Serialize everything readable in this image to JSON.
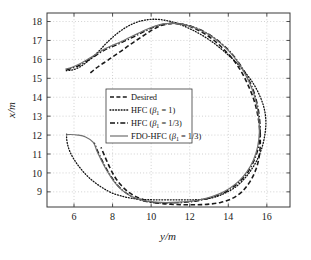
{
  "chart_data": {
    "type": "line",
    "title": "",
    "xlabel": "y/m",
    "ylabel": "x/m",
    "xlim": [
      4.6,
      17.2
    ],
    "ylim": [
      8.2,
      18.45
    ],
    "xticks": [
      6,
      8,
      10,
      12,
      14,
      16
    ],
    "yticks": [
      9,
      10,
      11,
      12,
      13,
      14,
      15,
      16,
      17,
      18
    ],
    "grid": true,
    "grid_style": "dotted",
    "legend_position": "center",
    "series": [
      {
        "name": "Desired",
        "style": "dashed",
        "color": "#1a1a1a",
        "points": [
          [
            6.85,
            15.28
          ],
          [
            7.1,
            15.5
          ],
          [
            7.4,
            15.72
          ],
          [
            7.75,
            15.95
          ],
          [
            8.1,
            16.2
          ],
          [
            8.5,
            16.48
          ],
          [
            8.9,
            16.78
          ],
          [
            9.3,
            17.05
          ],
          [
            9.7,
            17.32
          ],
          [
            10.1,
            17.58
          ],
          [
            10.5,
            17.78
          ],
          [
            10.9,
            17.88
          ],
          [
            11.3,
            17.9
          ],
          [
            11.75,
            17.82
          ],
          [
            12.2,
            17.66
          ],
          [
            12.7,
            17.4
          ],
          [
            13.2,
            17.05
          ],
          [
            13.7,
            16.6
          ],
          [
            14.2,
            16.05
          ],
          [
            14.65,
            15.4
          ],
          [
            15.0,
            14.7
          ],
          [
            15.3,
            13.95
          ],
          [
            15.5,
            13.2
          ],
          [
            15.62,
            12.4
          ],
          [
            15.66,
            11.6
          ],
          [
            15.6,
            10.85
          ],
          [
            15.42,
            10.15
          ],
          [
            15.1,
            9.5
          ],
          [
            14.7,
            9.0
          ],
          [
            14.2,
            8.65
          ],
          [
            13.6,
            8.44
          ],
          [
            13.0,
            8.35
          ],
          [
            12.4,
            8.32
          ],
          [
            11.8,
            8.32
          ],
          [
            11.2,
            8.34
          ],
          [
            10.6,
            8.38
          ],
          [
            10.1,
            8.45
          ],
          [
            9.6,
            8.58
          ],
          [
            9.15,
            8.78
          ],
          [
            8.75,
            9.05
          ],
          [
            8.4,
            9.4
          ],
          [
            8.1,
            9.82
          ],
          [
            7.85,
            10.3
          ],
          [
            7.62,
            10.82
          ],
          [
            7.4,
            11.35
          ]
        ]
      },
      {
        "name": "HFC (β₁ = 1)",
        "style": "dotted",
        "color": "#111111",
        "points": [
          [
            5.62,
            12.05
          ],
          [
            5.62,
            11.8
          ],
          [
            5.68,
            11.45
          ],
          [
            5.8,
            11.1
          ],
          [
            5.98,
            10.75
          ],
          [
            6.2,
            10.42
          ],
          [
            6.45,
            10.1
          ],
          [
            6.75,
            9.78
          ],
          [
            7.1,
            9.48
          ],
          [
            7.5,
            9.2
          ],
          [
            7.95,
            8.95
          ],
          [
            8.45,
            8.78
          ],
          [
            9.0,
            8.66
          ],
          [
            9.6,
            8.6
          ],
          [
            10.2,
            8.58
          ],
          [
            10.9,
            8.58
          ],
          [
            11.6,
            8.58
          ],
          [
            12.2,
            8.58
          ],
          [
            12.8,
            8.62
          ],
          [
            13.3,
            8.72
          ],
          [
            13.8,
            8.92
          ],
          [
            14.3,
            9.2
          ],
          [
            14.75,
            9.6
          ],
          [
            15.15,
            10.1
          ],
          [
            15.5,
            10.7
          ],
          [
            15.75,
            11.35
          ],
          [
            15.9,
            12.05
          ],
          [
            15.95,
            12.75
          ],
          [
            15.85,
            13.45
          ],
          [
            15.6,
            14.15
          ],
          [
            15.25,
            14.8
          ],
          [
            14.8,
            15.4
          ],
          [
            14.3,
            15.95
          ],
          [
            13.75,
            16.45
          ],
          [
            13.2,
            16.9
          ],
          [
            12.6,
            17.3
          ],
          [
            12.0,
            17.62
          ],
          [
            11.4,
            17.88
          ],
          [
            10.8,
            18.05
          ],
          [
            10.2,
            18.12
          ],
          [
            9.6,
            18.06
          ],
          [
            9.05,
            17.88
          ],
          [
            8.55,
            17.6
          ],
          [
            8.1,
            17.25
          ],
          [
            7.7,
            16.88
          ],
          [
            7.35,
            16.5
          ],
          [
            7.0,
            16.15
          ],
          [
            6.65,
            15.85
          ],
          [
            6.3,
            15.6
          ],
          [
            5.95,
            15.45
          ],
          [
            5.6,
            15.4
          ]
        ]
      },
      {
        "name": "HFC (β₁ = 1/3)",
        "style": "dashdot",
        "color": "#111111",
        "points": [
          [
            5.6,
            15.45
          ],
          [
            5.95,
            15.55
          ],
          [
            6.3,
            15.7
          ],
          [
            6.65,
            15.9
          ],
          [
            7.0,
            16.12
          ],
          [
            7.35,
            16.35
          ],
          [
            7.7,
            16.55
          ],
          [
            8.05,
            16.7
          ],
          [
            8.45,
            16.88
          ],
          [
            8.9,
            17.1
          ],
          [
            9.35,
            17.32
          ],
          [
            9.8,
            17.55
          ],
          [
            10.25,
            17.75
          ],
          [
            10.7,
            17.87
          ],
          [
            11.15,
            17.9
          ],
          [
            11.6,
            17.86
          ],
          [
            12.1,
            17.74
          ],
          [
            12.6,
            17.54
          ],
          [
            13.1,
            17.25
          ],
          [
            13.6,
            16.88
          ],
          [
            14.1,
            16.4
          ],
          [
            14.55,
            15.82
          ],
          [
            14.95,
            15.15
          ],
          [
            15.28,
            14.42
          ],
          [
            15.5,
            13.65
          ],
          [
            15.62,
            12.88
          ],
          [
            15.65,
            12.1
          ],
          [
            15.56,
            11.35
          ],
          [
            15.35,
            10.68
          ],
          [
            15.02,
            10.05
          ],
          [
            14.6,
            9.55
          ],
          [
            14.1,
            9.15
          ],
          [
            13.55,
            8.85
          ],
          [
            12.95,
            8.65
          ],
          [
            12.35,
            8.52
          ],
          [
            11.75,
            8.45
          ],
          [
            11.15,
            8.42
          ],
          [
            10.55,
            8.42
          ],
          [
            10.0,
            8.45
          ],
          [
            9.5,
            8.55
          ],
          [
            9.05,
            8.72
          ],
          [
            8.65,
            8.98
          ],
          [
            8.3,
            9.3
          ],
          [
            8.0,
            9.7
          ],
          [
            7.72,
            10.15
          ],
          [
            7.48,
            10.62
          ],
          [
            7.25,
            11.1
          ],
          [
            7.05,
            11.6
          ]
        ]
      },
      {
        "name": "FDO-HFC (β₁ = 1/3)",
        "style": "solid",
        "color": "#707070",
        "points": [
          [
            5.55,
            15.48
          ],
          [
            5.9,
            15.58
          ],
          [
            6.25,
            15.74
          ],
          [
            6.6,
            15.94
          ],
          [
            6.95,
            16.15
          ],
          [
            7.3,
            16.38
          ],
          [
            7.65,
            16.58
          ],
          [
            8.0,
            16.74
          ],
          [
            8.4,
            16.92
          ],
          [
            8.85,
            17.14
          ],
          [
            9.3,
            17.36
          ],
          [
            9.75,
            17.58
          ],
          [
            10.2,
            17.76
          ],
          [
            10.65,
            17.88
          ],
          [
            11.1,
            17.9
          ],
          [
            11.55,
            17.86
          ],
          [
            12.05,
            17.74
          ],
          [
            12.55,
            17.55
          ],
          [
            13.05,
            17.27
          ],
          [
            13.55,
            16.9
          ],
          [
            14.05,
            16.42
          ],
          [
            14.5,
            15.85
          ],
          [
            14.9,
            15.18
          ],
          [
            15.23,
            14.45
          ],
          [
            15.46,
            13.68
          ],
          [
            15.58,
            12.9
          ],
          [
            15.61,
            12.12
          ],
          [
            15.52,
            11.38
          ],
          [
            15.31,
            10.7
          ],
          [
            14.98,
            10.08
          ],
          [
            14.56,
            9.58
          ],
          [
            14.06,
            9.18
          ],
          [
            13.5,
            8.88
          ],
          [
            12.9,
            8.67
          ],
          [
            12.3,
            8.54
          ],
          [
            11.7,
            8.47
          ],
          [
            11.1,
            8.44
          ],
          [
            10.5,
            8.44
          ],
          [
            9.95,
            8.48
          ],
          [
            9.45,
            8.58
          ],
          [
            9.0,
            8.75
          ],
          [
            8.6,
            9.0
          ],
          [
            8.25,
            9.33
          ],
          [
            7.95,
            9.73
          ],
          [
            7.67,
            10.18
          ],
          [
            7.43,
            10.65
          ],
          [
            7.2,
            11.13
          ],
          [
            7.0,
            11.62
          ],
          [
            6.6,
            11.9
          ],
          [
            6.2,
            12.0
          ],
          [
            5.78,
            12.03
          ],
          [
            5.6,
            12.02
          ]
        ]
      }
    ],
    "legend_entries": [
      {
        "label_plain": "Desired",
        "style": "dashed"
      },
      {
        "label_plain": "HFC (β₁ = 1)",
        "style": "dotted"
      },
      {
        "label_plain": "HFC (β₁ = 1/3)",
        "style": "dashdot"
      },
      {
        "label_plain": "FDO-HFC (β₁ = 1/3)",
        "style": "solid"
      }
    ]
  },
  "axis": {
    "x_label": "y/m",
    "y_label": "x/m",
    "x_tick_labels": [
      "6",
      "8",
      "10",
      "12",
      "14",
      "16"
    ],
    "y_tick_labels": [
      "9",
      "10",
      "11",
      "12",
      "13",
      "14",
      "15",
      "16",
      "17",
      "18"
    ]
  },
  "legend": {
    "item0_name": "Desired",
    "item1_prefix": "HFC (",
    "item1_beta": "β",
    "item1_sub": "1",
    "item1_suffix": " = 1)",
    "item2_prefix": "HFC (",
    "item2_suffix": " = 1/3)",
    "item3_prefix": "FDO-HFC (",
    "item3_suffix": " = 1/3)"
  },
  "colors": {
    "frame": "#3a3a3a",
    "grid": "#b4b4b4",
    "desired": "#1a1a1a",
    "hfc1": "#111111",
    "hfc13": "#111111",
    "fdohfc": "#707070"
  }
}
